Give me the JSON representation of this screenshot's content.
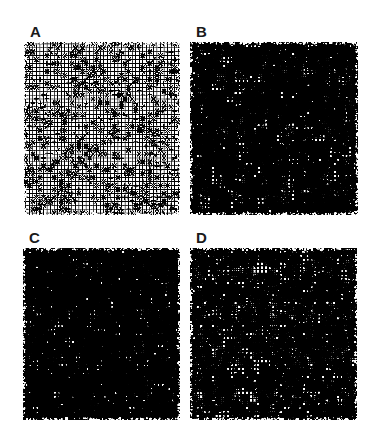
{
  "figure": {
    "title": "",
    "background_color": "#ffffff",
    "ink_color": "#000000",
    "width": 380,
    "height": 444
  },
  "chart_data": {
    "type": "heatmap",
    "title": "",
    "subtitle": "",
    "xlabel": "",
    "ylabel": "",
    "categories": [
      "A",
      "B",
      "C",
      "D"
    ],
    "values": [
      0.38,
      0.72,
      0.76,
      0.7
    ],
    "series": [
      {
        "name": "ink_coverage_fraction",
        "values": [
          0.38,
          0.72,
          0.76,
          0.7
        ]
      },
      {
        "name": "stroke_width_px",
        "values": [
          1.2,
          2.4,
          2.6,
          2.3
        ]
      }
    ],
    "grid_cells_x": 44,
    "grid_cells_y": 44,
    "legend": [],
    "grid": false
  },
  "panels": [
    {
      "id": "panel-a",
      "label": "A",
      "label_x": 30,
      "label_y": 24,
      "plate_x": 24,
      "plate_y": 42,
      "plate_w": 156,
      "plate_h": 173,
      "cells": 44,
      "stroke": 1.15,
      "density": 0.38,
      "seed": 1741,
      "jitter": 0.2,
      "noise": 0.1
    },
    {
      "id": "panel-b",
      "label": "B",
      "label_x": 196,
      "label_y": 24,
      "plate_x": 190,
      "plate_y": 42,
      "plate_w": 168,
      "plate_h": 173,
      "cells": 44,
      "stroke": 2.45,
      "density": 0.72,
      "seed": 9023,
      "jitter": 0.26,
      "noise": 0.13
    },
    {
      "id": "panel-c",
      "label": "C",
      "label_x": 29,
      "label_y": 230,
      "plate_x": 23,
      "plate_y": 248,
      "plate_w": 157,
      "plate_h": 172,
      "cells": 44,
      "stroke": 2.6,
      "density": 0.76,
      "seed": 3355,
      "jitter": 0.28,
      "noise": 0.14
    },
    {
      "id": "panel-d",
      "label": "D",
      "label_x": 196,
      "label_y": 230,
      "plate_x": 190,
      "plate_y": 248,
      "plate_w": 167,
      "plate_h": 172,
      "cells": 44,
      "stroke": 2.3,
      "density": 0.7,
      "seed": 6187,
      "jitter": 0.25,
      "noise": 0.12
    }
  ]
}
